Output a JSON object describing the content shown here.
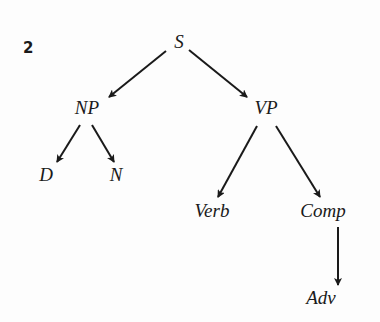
{
  "figure": {
    "number": "2"
  },
  "tree": {
    "nodes": {
      "S": "S",
      "NP": "NP",
      "VP": "VP",
      "D": "D",
      "N": "N",
      "Verb": "Verb",
      "Comp": "Comp",
      "Adv": "Adv"
    },
    "edges": [
      {
        "from": "S",
        "to": "NP"
      },
      {
        "from": "S",
        "to": "VP"
      },
      {
        "from": "NP",
        "to": "D"
      },
      {
        "from": "NP",
        "to": "N"
      },
      {
        "from": "VP",
        "to": "Verb"
      },
      {
        "from": "VP",
        "to": "Comp"
      },
      {
        "from": "Comp",
        "to": "Adv"
      }
    ],
    "edge_color": "#1a1a1a"
  }
}
